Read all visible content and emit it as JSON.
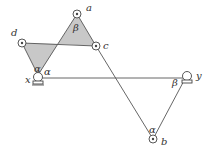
{
  "diagram": {
    "type": "linkage",
    "points": {
      "a": {
        "label": "a",
        "x": 77,
        "y": 14
      },
      "b": {
        "label": "b",
        "x": 153,
        "y": 139
      },
      "c": {
        "label": "c",
        "x": 96,
        "y": 46
      },
      "d": {
        "label": "d",
        "x": 22,
        "y": 43
      },
      "x": {
        "label": "x",
        "x": 38,
        "y": 75
      },
      "y": {
        "label": "y",
        "x": 187,
        "y": 75
      }
    },
    "angles": {
      "beta_top": "β",
      "alpha_x_upper": "α",
      "alpha_x_right": "α",
      "beta_y": "β",
      "alpha_b": "α"
    },
    "colors": {
      "line": "#555555",
      "shade": "#c8c8c8",
      "background": "#ffffff"
    }
  }
}
